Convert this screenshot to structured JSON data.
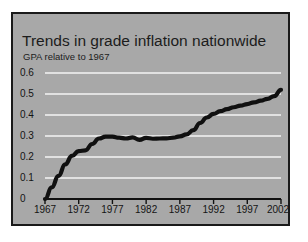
{
  "chart_data": {
    "type": "line",
    "title": "Trends in grade inflation nationwide",
    "subtitle": "GPA relative to 1967",
    "xlabel": "",
    "ylabel": "GPA relative to 1967",
    "ylim": [
      0,
      0.6
    ],
    "xlim": [
      1967,
      2002
    ],
    "grid": "horizontal",
    "legend": "none",
    "y_ticks": [
      "0",
      "0.1",
      "0.2",
      "0.3",
      "0.4",
      "0.5",
      "0.6"
    ],
    "y_tick_values": [
      0,
      0.1,
      0.2,
      0.3,
      0.4,
      0.5,
      0.6
    ],
    "x_ticks": [
      "1967",
      "1972",
      "1977",
      "1982",
      "1987",
      "1992",
      "1997",
      "2002"
    ],
    "x_tick_values": [
      1967,
      1972,
      1977,
      1982,
      1987,
      1992,
      1997,
      2002
    ],
    "series": [
      {
        "name": "GPA relative to 1967",
        "color": "#101010",
        "x": [
          1967,
          1968,
          1969,
          1970,
          1971,
          1972,
          1973,
          1974,
          1975,
          1976,
          1977,
          1978,
          1979,
          1980,
          1981,
          1982,
          1983,
          1984,
          1985,
          1986,
          1987,
          1988,
          1989,
          1990,
          1991,
          1992,
          1993,
          1994,
          1995,
          1996,
          1997,
          1998,
          1999,
          2000,
          2001,
          2002
        ],
        "values": [
          0.0,
          0.055,
          0.11,
          0.165,
          0.205,
          0.228,
          0.232,
          0.262,
          0.288,
          0.297,
          0.297,
          0.292,
          0.288,
          0.293,
          0.282,
          0.291,
          0.287,
          0.288,
          0.289,
          0.292,
          0.298,
          0.308,
          0.328,
          0.362,
          0.388,
          0.405,
          0.418,
          0.428,
          0.437,
          0.445,
          0.452,
          0.46,
          0.468,
          0.477,
          0.49,
          0.52
        ]
      }
    ]
  },
  "figure": {
    "background_color": "#a8a8a8",
    "page_color": "#ffffff",
    "border_color": "#1a1a1a",
    "grid_color": "#f4f4f4",
    "axis_color": "#111111"
  }
}
